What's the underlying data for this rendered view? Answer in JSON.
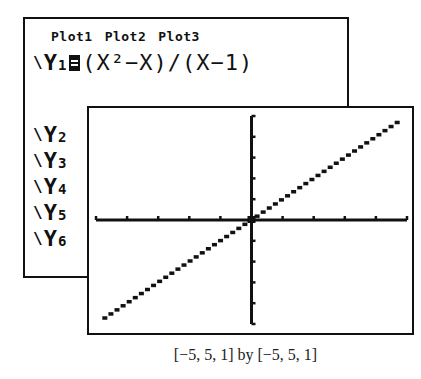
{
  "y_editor": {
    "plots": [
      "Plot1",
      "Plot2",
      "Plot3"
    ],
    "functions": [
      {
        "name": "Y",
        "sub": "1",
        "selected": true,
        "expression": "(X²−X)/(X−1)"
      },
      {
        "name": "Y",
        "sub": "2",
        "selected": false,
        "expression": ""
      },
      {
        "name": "Y",
        "sub": "3",
        "selected": false,
        "expression": ""
      },
      {
        "name": "Y",
        "sub": "4",
        "selected": false,
        "expression": ""
      },
      {
        "name": "Y",
        "sub": "5",
        "selected": false,
        "expression": ""
      },
      {
        "name": "Y",
        "sub": "6",
        "selected": false,
        "expression": ""
      }
    ],
    "slash_glyph": "\\"
  },
  "graph": {
    "window": {
      "xmin": -5,
      "xmax": 5,
      "xscl": 1,
      "ymin": -5,
      "ymax": 5,
      "yscl": 1
    },
    "plotted_function": "y = x (hole at x = 1)",
    "axis_color": "#111111",
    "plot_color": "#111111"
  },
  "caption": "[−5, 5, 1] by [−5, 5, 1]"
}
